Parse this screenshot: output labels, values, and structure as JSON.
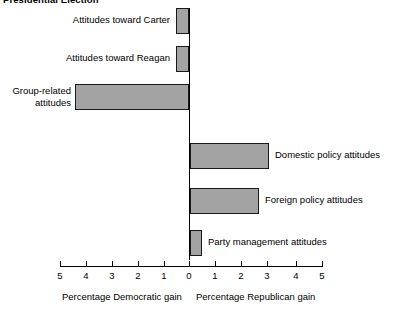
{
  "chart_data": {
    "type": "bar",
    "orientation": "horizontal",
    "title": "Presidential Election",
    "xlabel_left": "Percentage Democratic gain",
    "xlabel_right": "Percentage Republican gain",
    "ylabel": "",
    "xlim": [
      -5,
      5
    ],
    "xticks": [
      -5,
      -4,
      -3,
      -2,
      -1,
      0,
      1,
      2,
      3,
      4,
      5
    ],
    "xtick_labels": [
      "5",
      "4",
      "3",
      "2",
      "1",
      "0",
      "1",
      "2",
      "3",
      "4",
      "5"
    ],
    "grid": false,
    "legend": false,
    "bar_color": "#a3a3a3",
    "bar_edge_color": "#1a1a1a",
    "categories": [
      "Attitudes toward Carter",
      "Attitudes toward Reagan",
      "Group-related\nattitudes",
      "Domestic policy attitudes",
      "Foreign policy attitudes",
      "Party management attitudes"
    ],
    "values": [
      -0.5,
      -0.5,
      -4.3,
      3.0,
      2.6,
      0.45
    ],
    "points": [
      {
        "label": "Attitudes toward Carter",
        "value": -0.5,
        "direction": "democratic",
        "magnitude": 0.5
      },
      {
        "label": "Attitudes toward Reagan",
        "value": -0.5,
        "direction": "democratic",
        "magnitude": 0.5
      },
      {
        "label": "Group-related\nattitudes",
        "value": -4.3,
        "direction": "democratic",
        "magnitude": 4.3
      },
      {
        "label": "Domestic policy attitudes",
        "value": 3.0,
        "direction": "republican",
        "magnitude": 3.0
      },
      {
        "label": "Foreign policy attitudes",
        "value": 2.6,
        "direction": "republican",
        "magnitude": 2.6
      },
      {
        "label": "Party management attitudes",
        "value": 0.45,
        "direction": "republican",
        "magnitude": 0.45
      }
    ]
  },
  "labels": {
    "cat0": "Attitudes toward Carter",
    "cat1": "Attitudes toward Reagan",
    "cat2": "Group-related\nattitudes",
    "cat3": "Domestic policy attitudes",
    "cat4": "Foreign policy attitudes",
    "cat5": "Party management attitudes"
  },
  "ticks": {
    "t0": "5",
    "t1": "4",
    "t2": "3",
    "t3": "2",
    "t4": "1",
    "t5": "0",
    "t6": "1",
    "t7": "2",
    "t8": "3",
    "t9": "4",
    "t10": "5"
  },
  "captions": {
    "left": "Percentage Democratic gain",
    "right": "Percentage Republican gain"
  },
  "title": "Presidential Election"
}
